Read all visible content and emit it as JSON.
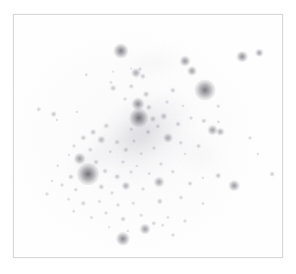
{
  "page": {
    "background_color": "#ffffff"
  },
  "plate": {
    "frame_color": "#d9d9d9",
    "sky_color": "#fefefe",
    "x": 13,
    "y": 14,
    "width": 270,
    "height": 244,
    "rendering": "inverted grayscale (negative) — dark sources on light sky",
    "caption": ""
  },
  "chart_data": {
    "type": "scatter",
    "title": "",
    "xlabel": "",
    "ylabel": "",
    "xlim": [
      0,
      270
    ],
    "ylim": [
      0,
      244
    ],
    "grid": false,
    "legend": "none",
    "note": "Point sources (stars / compact objects) in image-pixel coordinates relative to the plate interior. 'r' is apparent radius in px, 'i' is darkness 0-1 in the inverted render.",
    "columns": [
      "x",
      "y",
      "r",
      "i"
    ],
    "points": [
      [
        108,
        36,
        3.6,
        0.62
      ],
      [
        127,
        54,
        1.2,
        0.22
      ],
      [
        172,
        46,
        2.6,
        0.5
      ],
      [
        230,
        42,
        2.8,
        0.55
      ],
      [
        247,
        38,
        2.0,
        0.45
      ],
      [
        179,
        56,
        2.4,
        0.46
      ],
      [
        192,
        76,
        5.0,
        0.66
      ],
      [
        73,
        60,
        1.1,
        0.2
      ],
      [
        100,
        57,
        0.9,
        0.18
      ],
      [
        118,
        54,
        0.9,
        0.18
      ],
      [
        130,
        62,
        1.5,
        0.26
      ],
      [
        98,
        68,
        1.0,
        0.2
      ],
      [
        118,
        72,
        1.3,
        0.24
      ],
      [
        123,
        58,
        2.4,
        0.42
      ],
      [
        100,
        74,
        1.6,
        0.28
      ],
      [
        133,
        80,
        1.6,
        0.3
      ],
      [
        112,
        85,
        1.2,
        0.22
      ],
      [
        160,
        76,
        1.5,
        0.26
      ],
      [
        154,
        88,
        1.2,
        0.22
      ],
      [
        125,
        90,
        3.1,
        0.56
      ],
      [
        136,
        93,
        1.5,
        0.28
      ],
      [
        170,
        92,
        1.0,
        0.2
      ],
      [
        25,
        95,
        1.3,
        0.24
      ],
      [
        40,
        100,
        1.6,
        0.3
      ],
      [
        63,
        98,
        1.0,
        0.2
      ],
      [
        206,
        92,
        1.1,
        0.22
      ],
      [
        126,
        104,
        4.6,
        0.7
      ],
      [
        140,
        105,
        1.7,
        0.3
      ],
      [
        151,
        102,
        1.8,
        0.32
      ],
      [
        43,
        106,
        1.0,
        0.2
      ],
      [
        165,
        110,
        1.4,
        0.26
      ],
      [
        178,
        104,
        1.2,
        0.22
      ],
      [
        191,
        107,
        1.5,
        0.26
      ],
      [
        206,
        108,
        1.0,
        0.2
      ],
      [
        118,
        115,
        1.1,
        0.22
      ],
      [
        93,
        112,
        1.5,
        0.26
      ],
      [
        80,
        118,
        1.6,
        0.3
      ],
      [
        135,
        118,
        1.4,
        0.26
      ],
      [
        145,
        112,
        1.3,
        0.24
      ],
      [
        200,
        116,
        2.6,
        0.48
      ],
      [
        208,
        118,
        2.0,
        0.4
      ],
      [
        70,
        124,
        1.5,
        0.28
      ],
      [
        88,
        126,
        2.0,
        0.36
      ],
      [
        104,
        128,
        1.4,
        0.26
      ],
      [
        121,
        127,
        1.2,
        0.22
      ],
      [
        155,
        124,
        2.4,
        0.44
      ],
      [
        168,
        129,
        1.3,
        0.24
      ],
      [
        60,
        132,
        1.2,
        0.22
      ],
      [
        77,
        136,
        1.3,
        0.24
      ],
      [
        97,
        138,
        1.1,
        0.2
      ],
      [
        113,
        136,
        1.5,
        0.28
      ],
      [
        128,
        140,
        1.1,
        0.2
      ],
      [
        141,
        134,
        1.2,
        0.22
      ],
      [
        172,
        140,
        1.0,
        0.2
      ],
      [
        186,
        132,
        1.4,
        0.26
      ],
      [
        55,
        141,
        1.0,
        0.2
      ],
      [
        66,
        145,
        3.0,
        0.5
      ],
      [
        83,
        148,
        1.4,
        0.26
      ],
      [
        110,
        148,
        1.2,
        0.22
      ],
      [
        124,
        152,
        1.0,
        0.2
      ],
      [
        148,
        150,
        1.2,
        0.22
      ],
      [
        44,
        152,
        1.1,
        0.2
      ],
      [
        75,
        160,
        5.2,
        0.72
      ],
      [
        57,
        163,
        1.5,
        0.28
      ],
      [
        92,
        157,
        1.4,
        0.26
      ],
      [
        104,
        163,
        1.6,
        0.3
      ],
      [
        118,
        158,
        1.2,
        0.22
      ],
      [
        136,
        160,
        1.1,
        0.2
      ],
      [
        160,
        158,
        1.3,
        0.24
      ],
      [
        38,
        167,
        1.0,
        0.2
      ],
      [
        48,
        171,
        1.2,
        0.22
      ],
      [
        62,
        176,
        1.3,
        0.24
      ],
      [
        88,
        173,
        1.5,
        0.28
      ],
      [
        99,
        179,
        1.2,
        0.22
      ],
      [
        113,
        172,
        2.2,
        0.4
      ],
      [
        130,
        175,
        1.2,
        0.22
      ],
      [
        146,
        168,
        2.6,
        0.46
      ],
      [
        177,
        170,
        1.4,
        0.26
      ],
      [
        190,
        164,
        1.0,
        0.2
      ],
      [
        206,
        162,
        1.6,
        0.3
      ],
      [
        33,
        180,
        1.2,
        0.22
      ],
      [
        55,
        186,
        1.1,
        0.2
      ],
      [
        70,
        190,
        1.3,
        0.24
      ],
      [
        86,
        188,
        1.0,
        0.2
      ],
      [
        105,
        192,
        1.2,
        0.22
      ],
      [
        120,
        190,
        1.1,
        0.2
      ],
      [
        147,
        188,
        1.5,
        0.28
      ],
      [
        168,
        184,
        1.2,
        0.22
      ],
      [
        222,
        172,
        2.8,
        0.5
      ],
      [
        60,
        198,
        1.1,
        0.2
      ],
      [
        78,
        204,
        1.0,
        0.2
      ],
      [
        93,
        200,
        1.2,
        0.22
      ],
      [
        110,
        206,
        1.4,
        0.26
      ],
      [
        128,
        202,
        1.1,
        0.2
      ],
      [
        141,
        210,
        1.3,
        0.24
      ],
      [
        155,
        204,
        1.0,
        0.2
      ],
      [
        172,
        208,
        1.2,
        0.22
      ],
      [
        96,
        214,
        0.9,
        0.18
      ],
      [
        115,
        218,
        1.0,
        0.2
      ],
      [
        132,
        216,
        2.6,
        0.48
      ],
      [
        150,
        212,
        1.1,
        0.2
      ],
      [
        110,
        226,
        3.4,
        0.58
      ],
      [
        160,
        222,
        1.2,
        0.22
      ],
      [
        260,
        160,
        1.4,
        0.26
      ],
      [
        246,
        140,
        1.0,
        0.2
      ],
      [
        238,
        124,
        1.2,
        0.22
      ],
      [
        190,
        190,
        1.0,
        0.2
      ]
    ],
    "diffuse_structures": [
      {
        "name": "central-filament",
        "cx": 126,
        "cy": 118,
        "rx": 78,
        "ry": 38,
        "angle": -34,
        "opacity": 0.3
      },
      {
        "name": "north-halo",
        "cx": 140,
        "cy": 48,
        "rx": 52,
        "ry": 22,
        "angle": -8,
        "opacity": 0.12
      },
      {
        "name": "west-wing",
        "cx": 78,
        "cy": 146,
        "rx": 40,
        "ry": 20,
        "angle": -40,
        "opacity": 0.16
      },
      {
        "name": "east-diffuse",
        "cx": 186,
        "cy": 140,
        "rx": 44,
        "ry": 28,
        "angle": 18,
        "opacity": 0.1
      }
    ]
  }
}
